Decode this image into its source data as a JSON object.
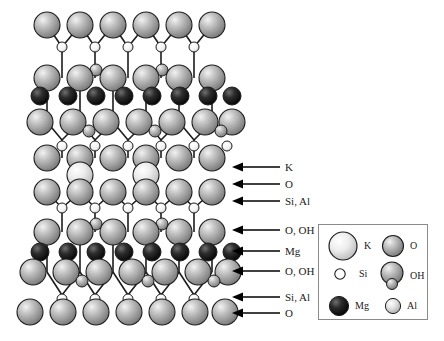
{
  "figure": {
    "background_color": "#ffffff"
  },
  "structure": {
    "description": "Ball-and-stick cross-section of a 2:1 layered silicate showing stacked tetrahedral and octahedral sheets with an interlayer cation plane",
    "layers": [
      {
        "id": "t-sheet-1-apical-o",
        "label": "O",
        "y": 25,
        "species": "O"
      },
      {
        "id": "t-sheet-1-si",
        "label": "Si, Al",
        "y": 47,
        "species": "Si"
      },
      {
        "id": "t-sheet-1-basal-o",
        "label": "O, OH",
        "y": 78,
        "species": "O"
      },
      {
        "id": "oct-sheet-1-mg",
        "label": "Mg",
        "y": 96,
        "species": "Mg"
      },
      {
        "id": "oct-sheet-1-o",
        "label": "O, OH",
        "y": 122,
        "species": "O"
      },
      {
        "id": "t-sheet-2-si",
        "label": "Si, Al",
        "y": 140,
        "species": "Si"
      },
      {
        "id": "t-sheet-2-o",
        "label": "O",
        "y": 158,
        "species": "O"
      },
      {
        "id": "interlayer-k",
        "label": "K",
        "y": 175,
        "species": "K"
      },
      {
        "id": "t-sheet-3-o",
        "label": "O",
        "y": 192,
        "species": "O"
      },
      {
        "id": "t-sheet-3-si",
        "label": "Si, Al",
        "y": 208,
        "species": "Si"
      },
      {
        "id": "t-sheet-3-basal-o",
        "label": "O, OH",
        "y": 232,
        "species": "O"
      },
      {
        "id": "oct-sheet-2-mg",
        "label": "Mg",
        "y": 252,
        "species": "Mg"
      },
      {
        "id": "oct-sheet-2-o",
        "label": "O, OH",
        "y": 272,
        "species": "O"
      },
      {
        "id": "t-sheet-4-si",
        "label": "Si, Al",
        "y": 295,
        "species": "Si"
      },
      {
        "id": "t-sheet-4-o",
        "label": "O",
        "y": 312,
        "species": "O"
      }
    ]
  },
  "callouts": [
    {
      "id": "callout-k",
      "label": "K",
      "y": 167,
      "x": 232,
      "target_layer": "interlayer-k"
    },
    {
      "id": "callout-o-1",
      "label": "O",
      "y": 184,
      "x": 232,
      "target_layer": "t-sheet-3-o"
    },
    {
      "id": "callout-si-al-1",
      "label": "Si, Al",
      "y": 201,
      "x": 232,
      "target_layer": "t-sheet-3-si"
    },
    {
      "id": "callout-o-oh-1",
      "label": "O, OH",
      "y": 230,
      "x": 232,
      "target_layer": "t-sheet-3-basal-o"
    },
    {
      "id": "callout-mg",
      "label": "Mg",
      "y": 251,
      "x": 232,
      "target_layer": "oct-sheet-2-mg"
    },
    {
      "id": "callout-o-oh-2",
      "label": "O, OH",
      "y": 271,
      "x": 232,
      "target_layer": "oct-sheet-2-o"
    },
    {
      "id": "callout-si-al-2",
      "label": "Si, Al",
      "y": 297,
      "x": 232,
      "target_layer": "t-sheet-4-si"
    },
    {
      "id": "callout-o-2",
      "label": "O",
      "y": 313,
      "x": 232,
      "target_layer": "t-sheet-4-o"
    }
  ],
  "legend": {
    "columns": 2,
    "items": [
      {
        "id": "legend-k",
        "label": "K",
        "radius": 15,
        "fill": "#e8e8e8",
        "column": 0,
        "row": 0,
        "has_hydroxyl_lobe": false
      },
      {
        "id": "legend-o",
        "label": "O",
        "radius": 11,
        "fill": "#9a9a9a",
        "column": 1,
        "row": 0,
        "has_hydroxyl_lobe": false
      },
      {
        "id": "legend-si",
        "label": "Si",
        "radius": 5,
        "fill": "#fdfdfd",
        "column": 0,
        "row": 1,
        "has_hydroxyl_lobe": false
      },
      {
        "id": "legend-oh",
        "label": "OH",
        "radius": 12,
        "fill": "#9a9a9a",
        "column": 1,
        "row": 1,
        "has_hydroxyl_lobe": true
      },
      {
        "id": "legend-mg",
        "label": "Mg",
        "radius": 10,
        "fill": "#141414",
        "column": 0,
        "row": 2,
        "has_hydroxyl_lobe": false
      },
      {
        "id": "legend-al",
        "label": "Al",
        "radius": 8,
        "fill": "#d0d0d0",
        "column": 1,
        "row": 2,
        "has_hydroxyl_lobe": false
      }
    ]
  },
  "colors": {
    "sphere_o": "#9a9a9a",
    "sphere_k": "#e4e4e4",
    "sphere_si": "#fcfcfc",
    "sphere_mg": "#141414",
    "sphere_al": "#d0d0d0",
    "outline": "#1d1d1d",
    "bond": "#1d1d1d",
    "arrow": "#000000",
    "legend_border": "#8a8a8a",
    "background": "#ffffff"
  }
}
